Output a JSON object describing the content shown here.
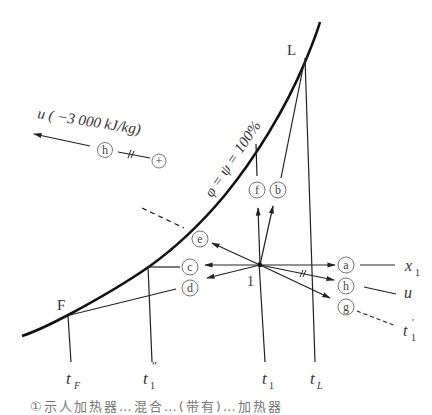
{
  "diagram": {
    "curve_label": "φ = ψ = 100%",
    "points": {
      "L": "L",
      "F": "F",
      "state1": "1"
    },
    "axis_labels": {
      "tF": "t",
      "tF_sub": "F",
      "t1pp": "t",
      "t1pp_sub": "1",
      "t1pp_sup": "″",
      "t1": "t",
      "t1_sub": "1",
      "tL": "t",
      "tL_sub": "L"
    },
    "circled_labels": {
      "a": "a",
      "b": "b",
      "c": "c",
      "d": "d",
      "e": "e",
      "f": "f",
      "g": "g",
      "h": "h",
      "h_ref": "h",
      "plus": "+"
    },
    "legend_right": {
      "x1": "x",
      "x1_sub": "1",
      "u": "u",
      "t1p": "t",
      "t1p_sub": "1",
      "t1p_sup": "′"
    },
    "scale_note": {
      "text": "u ( −3 000 kJ/kg)"
    },
    "caption_partial": "①示人加热器…混合…(带有)…加热器"
  }
}
